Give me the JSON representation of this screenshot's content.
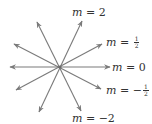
{
  "diagram": {
    "center": [
      60,
      67
    ],
    "line_color": "#7a7a7a",
    "text_color": "#333333",
    "lines": [
      {
        "slope_label": "m = 2",
        "from": [
          37,
          22
        ],
        "to": [
          82,
          111
        ],
        "tip_a": [
          82,
          21
        ],
        "tip_b": [
          39,
          112
        ]
      },
      {
        "slope_label": "m = 1/2",
        "from": [
          14,
          90
        ],
        "to": [
          102,
          44
        ]
      },
      {
        "slope_label": "m = 0",
        "from": [
          10,
          67
        ],
        "to": [
          110,
          67
        ]
      },
      {
        "slope_label": "m = -1/2",
        "from": [
          14,
          44
        ],
        "to": [
          101,
          89
        ]
      },
      {
        "slope_label": "m = -2",
        "from": [
          37,
          22
        ],
        "to": [
          81,
          111
        ]
      }
    ],
    "labels": {
      "m2": {
        "var": "m",
        "eq": " = ",
        "value": "2"
      },
      "mhalf": {
        "var": "m",
        "eq": " = ",
        "num": "1",
        "den": "2"
      },
      "m0": {
        "var": "m",
        "eq": " = ",
        "value": "0"
      },
      "mneghalf": {
        "var": "m",
        "eq": " = −",
        "num": "1",
        "den": "2"
      },
      "mneg2": {
        "var": "m",
        "eq": " = ",
        "value": "−2"
      }
    }
  }
}
